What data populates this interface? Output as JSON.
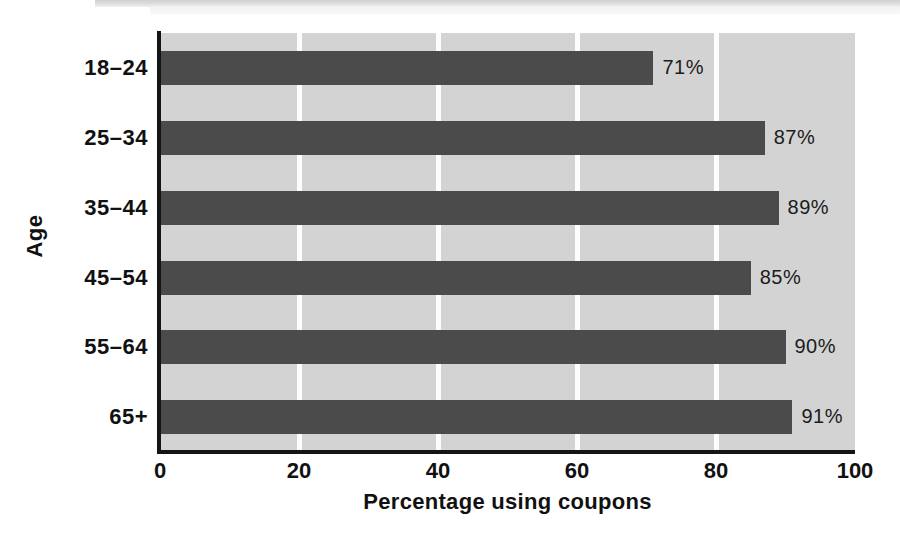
{
  "chart_data": {
    "type": "bar",
    "orientation": "horizontal",
    "title": "",
    "categories": [
      "18–24",
      "25–34",
      "35–44",
      "45–54",
      "55–64",
      "65+"
    ],
    "values": [
      71,
      87,
      89,
      85,
      90,
      91
    ],
    "data_labels": [
      "71%",
      "87%",
      "89%",
      "85%",
      "90%",
      "91%"
    ],
    "xlabel": "Percentage using coupons",
    "ylabel": "Age",
    "xlim": [
      0,
      100
    ],
    "xticks": [
      0,
      20,
      40,
      60,
      80,
      100
    ],
    "xtick_labels": [
      "0",
      "20",
      "40",
      "60",
      "80",
      "100"
    ],
    "grid": "vertical-white-gridlines",
    "legend": "none",
    "colors": {
      "bar": "#4b4b4b",
      "plot_background": "#d3d3d3",
      "gridline": "#fdfdfd",
      "axis": "#141414",
      "text": "#111111",
      "page_background": "#ffffff"
    }
  }
}
